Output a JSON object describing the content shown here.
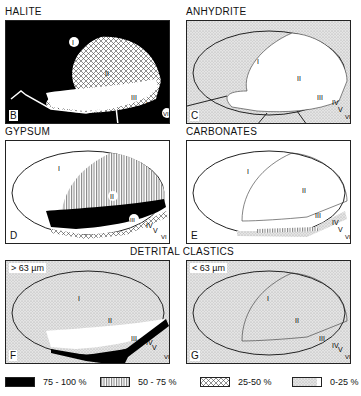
{
  "panels": [
    {
      "id": "B",
      "title": "HALITE",
      "letter": "B",
      "fill_zone": {
        "I": "75-100",
        "II": "25-50",
        "III": "0-25"
      }
    },
    {
      "id": "C",
      "title": "ANHYDRITE",
      "letter": "C",
      "fill_zone": {
        "I": "0-25",
        "II": "none",
        "III": "none"
      }
    },
    {
      "id": "D",
      "title": "GYPSUM",
      "letter": "D",
      "fill_zone": {
        "I": "none",
        "II": "50-75",
        "III": "75-100",
        "IV": "25-50"
      }
    },
    {
      "id": "E",
      "title": "CARBONATES",
      "letter": "E",
      "fill_zone": {
        "I": "none",
        "II": "none",
        "III": "50-75 / 0-25 margin"
      }
    },
    {
      "id": "F",
      "title": "",
      "letter": "F",
      "size": "> 63 µm",
      "fill_zone": {
        "I": "0-25",
        "II": "0-25",
        "III": "none",
        "rim": "75-100"
      }
    },
    {
      "id": "G",
      "title": "",
      "letter": "G",
      "size": "< 63 µm",
      "fill_zone": {
        "I": "0-25",
        "II": "0-25",
        "III": "0-25"
      }
    }
  ],
  "group_title": "DETRITAL   CLASTICS",
  "zones": {
    "I": "I",
    "II": "II",
    "III": "III",
    "IV": "IV",
    "V": "V",
    "VI": "VI"
  },
  "legend": [
    {
      "label": "75 - 100 %",
      "pattern": "black"
    },
    {
      "label": "50 - 75 %",
      "pattern": "vertical-lines"
    },
    {
      "label": "25-50 %",
      "pattern": "crosshatch"
    },
    {
      "label": "0-25 %",
      "pattern": "stipple"
    }
  ]
}
